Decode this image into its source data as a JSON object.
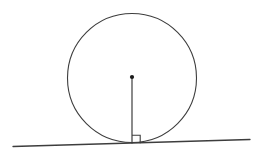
{
  "canvas": {
    "width": 261,
    "height": 160,
    "background_color": "#ffffff",
    "title": "Circle with tangent line and perpendicular radius"
  },
  "style": {
    "stroke_color": "#3d3d3d",
    "circle_stroke_width": 1.1,
    "line_stroke_width": 1.3,
    "radius_stroke_width": 1.2,
    "marker_stroke_width": 1.1,
    "dot_fill": "#1a1a1a"
  },
  "chart_data": {
    "type": "diagram",
    "subtype": "geometry-circle-tangent",
    "xlabel": "",
    "ylabel": "",
    "xlim": [
      0,
      261
    ],
    "ylim": [
      0,
      160
    ],
    "grid": false,
    "legend": null,
    "annotations": [],
    "shapes": [
      {
        "name": "circle",
        "type": "circle",
        "cx": 132,
        "cy": 78,
        "r": 64.5,
        "fill": "none",
        "stroke": "#3d3d3d"
      },
      {
        "name": "tangent-line",
        "type": "line",
        "x1": 13,
        "y1": 146.5,
        "x2": 250,
        "y2": 139.5,
        "stroke": "#3d3d3d"
      },
      {
        "name": "radius-segment",
        "type": "line",
        "x1": 132,
        "y1": 77.5,
        "x2": 132,
        "y2": 143.5,
        "stroke": "#3d3d3d"
      },
      {
        "name": "center-point",
        "type": "point",
        "cx": 132,
        "cy": 77,
        "r": 2.1,
        "fill": "#1a1a1a"
      },
      {
        "name": "right-angle-marker",
        "type": "polyline",
        "points": "132,135.2 140.2,135.2 140.2,143.3",
        "size": 8.2,
        "fill": "none",
        "stroke": "#3d3d3d"
      },
      {
        "name": "tangent-point",
        "type": "implicit-point",
        "cx": 132,
        "cy": 143.5
      }
    ]
  }
}
